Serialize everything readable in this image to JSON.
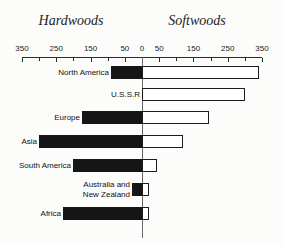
{
  "chart_data": {
    "type": "bar",
    "variant": "diverging-horizontal",
    "title": "",
    "categories": [
      "North America",
      "U.S.S.R",
      "Europe",
      "Asia",
      "South America",
      "Australia and\nNew Zealand",
      "Africa"
    ],
    "series": [
      {
        "name": "Hardwoods",
        "side": "left",
        "bar_color": "#161616",
        "values": [
          90,
          0,
          175,
          300,
          200,
          30,
          230
        ]
      },
      {
        "name": "Softwoods",
        "side": "right",
        "bar_color": "#ffffff",
        "values": [
          340,
          300,
          195,
          120,
          45,
          20,
          20
        ]
      }
    ],
    "axis": {
      "tick_labels": [
        "350",
        "250",
        "150",
        "50",
        "0",
        "50",
        "150",
        "250",
        "350"
      ],
      "major_tick_values": [
        350,
        250,
        150,
        50,
        0
      ],
      "minor_tick_values": [
        300,
        200,
        100
      ],
      "max": 350,
      "grid": false
    },
    "colors": {
      "bar_black": "#161616",
      "bar_white": "#ffffff",
      "line": "#2b2b2b",
      "background": "#fcfcfb"
    }
  }
}
